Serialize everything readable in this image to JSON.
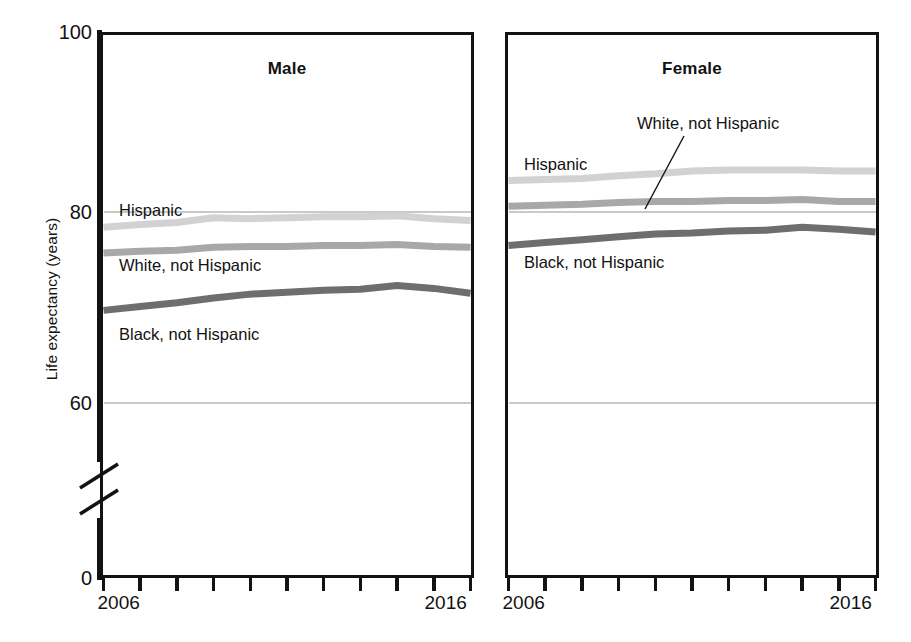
{
  "figure": {
    "ylabel": "Life expectancy (years)",
    "ytick_labels": [
      "100",
      "80",
      "60",
      "0"
    ],
    "axis_break": true,
    "panels": [
      {
        "title": "Male",
        "x_first_label": "2006",
        "x_last_label": "2016"
      },
      {
        "title": "Female",
        "x_first_label": "2006",
        "x_last_label": "2016"
      }
    ],
    "series_labels": {
      "hispanic": "Hispanic",
      "white": "White, not Hispanic",
      "black": "Black, not Hispanic"
    },
    "colors": {
      "hispanic": "#d2d2d2",
      "white": "#a8a8a8",
      "black": "#6e6e6e",
      "axis": "#121212",
      "grid": "#c9c9c9"
    }
  },
  "chart_data": {
    "type": "line",
    "title": "",
    "xlabel": "",
    "ylabel": "Life expectancy (years)",
    "ylim": [
      60,
      100
    ],
    "yticks": [
      60,
      80,
      100
    ],
    "y_axis_break_below": 60,
    "grid": true,
    "legend": "in-plot labels",
    "x": [
      2006,
      2007,
      2008,
      2009,
      2010,
      2011,
      2012,
      2013,
      2014,
      2015,
      2016
    ],
    "panels": [
      {
        "name": "Male",
        "series": [
          {
            "name": "Hispanic",
            "color": "#d2d2d2",
            "values": [
              78.4,
              78.7,
              78.9,
              79.4,
              79.3,
              79.4,
              79.5,
              79.5,
              79.6,
              79.3,
              79.1
            ]
          },
          {
            "name": "White, not Hispanic",
            "color": "#a8a8a8",
            "values": [
              75.7,
              75.9,
              76.0,
              76.3,
              76.4,
              76.4,
              76.5,
              76.5,
              76.6,
              76.4,
              76.3
            ]
          },
          {
            "name": "Black, not Hispanic",
            "color": "#6e6e6e",
            "values": [
              69.7,
              70.1,
              70.5,
              71.0,
              71.4,
              71.6,
              71.8,
              71.9,
              72.3,
              72.0,
              71.5
            ]
          }
        ]
      },
      {
        "name": "Female",
        "series": [
          {
            "name": "Hispanic",
            "color": "#d2d2d2",
            "values": [
              83.3,
              83.4,
              83.5,
              83.8,
              84.0,
              84.3,
              84.4,
              84.4,
              84.4,
              84.3,
              84.3
            ]
          },
          {
            "name": "White, not Hispanic",
            "color": "#a8a8a8",
            "values": [
              80.6,
              80.7,
              80.8,
              81.0,
              81.1,
              81.1,
              81.2,
              81.2,
              81.3,
              81.1,
              81.1
            ]
          },
          {
            "name": "Black, not Hispanic",
            "color": "#6e6e6e",
            "values": [
              76.5,
              76.8,
              77.1,
              77.4,
              77.7,
              77.8,
              78.0,
              78.1,
              78.4,
              78.2,
              77.9
            ]
          }
        ]
      }
    ]
  }
}
